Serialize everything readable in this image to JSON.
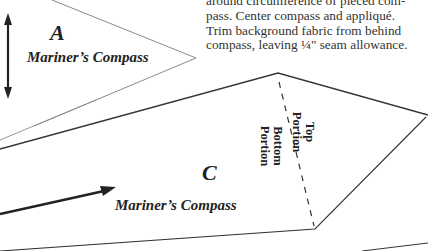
{
  "instructions": {
    "lines": [
      "around circumference of pieced com-",
      "pass.  Center compass and appliqué.",
      "Trim background fabric from behind",
      "compass, leaving ¼\" seam allowance."
    ]
  },
  "piece_a": {
    "letter": "A",
    "name": "Mariner’s Compass",
    "grain_arrow": "double-arrow-vertical"
  },
  "piece_c": {
    "letter": "C",
    "name": "Mariner’s Compass",
    "top_portion": [
      "Top",
      "Portion"
    ],
    "bottom_portion": [
      "Bottom",
      "Portion"
    ],
    "grain_arrow": "arrow-diagonal"
  },
  "colors": {
    "line_thin": "#777777",
    "line_dark": "#333333",
    "text": "#222222"
  }
}
